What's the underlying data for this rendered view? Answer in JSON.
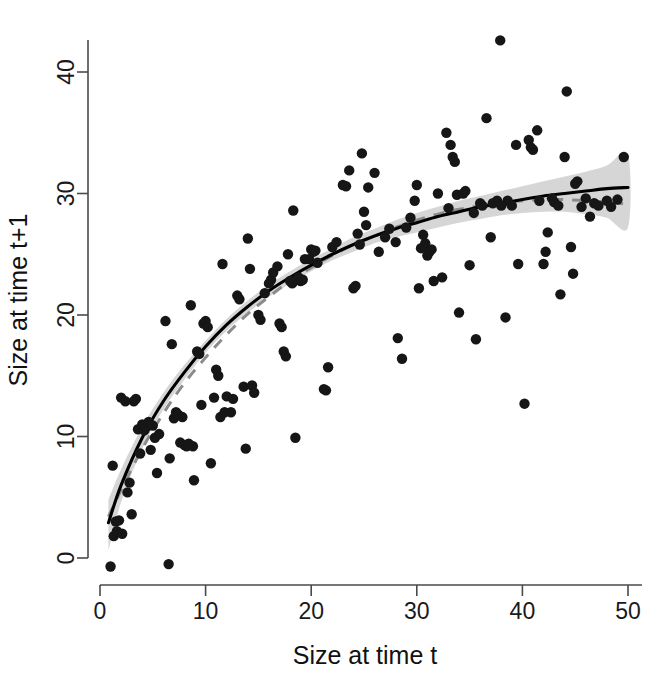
{
  "figure": {
    "background_color": "#ffffff",
    "width": 669,
    "height": 676
  },
  "chart_data": {
    "type": "scatter",
    "title": "",
    "subtitle": "",
    "xlabel": "Size at time t",
    "ylabel": "Size at time t+1",
    "xlim": [
      -1.5,
      52
    ],
    "ylim": [
      -3.0,
      45.5
    ],
    "xticks": [
      0,
      10,
      20,
      30,
      40,
      50
    ],
    "yticks": [
      0,
      10,
      20,
      30,
      40
    ],
    "xtick_labels": [
      "0",
      "10",
      "20",
      "30",
      "40",
      "50"
    ],
    "ytick_labels": [
      "0",
      "10",
      "20",
      "30",
      "40"
    ],
    "grid": false,
    "legend": false,
    "legend_position": "none",
    "point_color": "#161616",
    "point_radius": 5.2,
    "n_points": 178,
    "points": [
      [
        1.0,
        -0.7
      ],
      [
        1.2,
        7.6
      ],
      [
        1.3,
        1.8
      ],
      [
        1.5,
        3.0
      ],
      [
        1.6,
        2.2
      ],
      [
        1.8,
        3.1
      ],
      [
        2.0,
        13.2
      ],
      [
        2.1,
        2.0
      ],
      [
        2.4,
        12.9
      ],
      [
        2.6,
        5.4
      ],
      [
        2.8,
        6.2
      ],
      [
        3.0,
        3.6
      ],
      [
        3.2,
        12.9
      ],
      [
        3.4,
        13.1
      ],
      [
        3.6,
        10.6
      ],
      [
        3.8,
        8.6
      ],
      [
        4.0,
        11.0
      ],
      [
        4.2,
        10.5
      ],
      [
        4.4,
        10.8
      ],
      [
        4.6,
        11.2
      ],
      [
        4.8,
        8.9
      ],
      [
        5.0,
        10.9
      ],
      [
        5.2,
        9.9
      ],
      [
        5.4,
        7.0
      ],
      [
        5.6,
        10.2
      ],
      [
        6.2,
        19.5
      ],
      [
        6.5,
        -0.5
      ],
      [
        6.6,
        8.2
      ],
      [
        6.8,
        17.6
      ],
      [
        7.0,
        11.5
      ],
      [
        7.2,
        12.0
      ],
      [
        7.4,
        11.8
      ],
      [
        7.6,
        9.5
      ],
      [
        7.8,
        11.6
      ],
      [
        8.0,
        9.3
      ],
      [
        8.2,
        9.2
      ],
      [
        8.4,
        9.4
      ],
      [
        8.6,
        20.8
      ],
      [
        8.8,
        9.2
      ],
      [
        8.9,
        6.4
      ],
      [
        9.2,
        17.0
      ],
      [
        9.4,
        16.8
      ],
      [
        9.6,
        12.6
      ],
      [
        9.8,
        19.3
      ],
      [
        10.0,
        19.5
      ],
      [
        10.2,
        19.0
      ],
      [
        10.5,
        7.8
      ],
      [
        10.8,
        13.2
      ],
      [
        11.0,
        15.5
      ],
      [
        11.2,
        15.0
      ],
      [
        11.4,
        11.6
      ],
      [
        11.6,
        24.2
      ],
      [
        11.8,
        12.0
      ],
      [
        12.0,
        13.3
      ],
      [
        12.4,
        12.0
      ],
      [
        12.6,
        13.1
      ],
      [
        13.0,
        21.6
      ],
      [
        13.2,
        21.3
      ],
      [
        13.6,
        14.1
      ],
      [
        13.8,
        9.0
      ],
      [
        14.0,
        26.3
      ],
      [
        14.2,
        23.8
      ],
      [
        14.4,
        14.2
      ],
      [
        14.6,
        13.6
      ],
      [
        15.0,
        20.0
      ],
      [
        15.2,
        19.6
      ],
      [
        15.6,
        21.8
      ],
      [
        16.0,
        22.6
      ],
      [
        16.2,
        22.9
      ],
      [
        16.4,
        23.5
      ],
      [
        16.8,
        24.0
      ],
      [
        17.0,
        19.3
      ],
      [
        17.2,
        19.0
      ],
      [
        17.4,
        17.0
      ],
      [
        17.6,
        16.6
      ],
      [
        17.8,
        25.0
      ],
      [
        18.0,
        22.8
      ],
      [
        18.2,
        22.6
      ],
      [
        18.3,
        28.6
      ],
      [
        18.5,
        9.9
      ],
      [
        18.8,
        23.1
      ],
      [
        19.0,
        22.8
      ],
      [
        19.2,
        22.9
      ],
      [
        19.4,
        24.6
      ],
      [
        19.8,
        24.6
      ],
      [
        20.0,
        25.4
      ],
      [
        20.2,
        25.2
      ],
      [
        20.4,
        25.3
      ],
      [
        20.6,
        24.3
      ],
      [
        21.2,
        13.9
      ],
      [
        21.4,
        13.8
      ],
      [
        21.6,
        15.7
      ],
      [
        22.0,
        25.6
      ],
      [
        22.4,
        26.0
      ],
      [
        23.0,
        30.7
      ],
      [
        23.3,
        30.6
      ],
      [
        23.6,
        31.9
      ],
      [
        24.0,
        22.2
      ],
      [
        24.2,
        22.4
      ],
      [
        24.4,
        26.7
      ],
      [
        24.6,
        25.8
      ],
      [
        24.8,
        33.3
      ],
      [
        25.0,
        28.5
      ],
      [
        25.2,
        27.4
      ],
      [
        25.4,
        30.5
      ],
      [
        26.0,
        31.7
      ],
      [
        26.4,
        25.2
      ],
      [
        27.0,
        26.4
      ],
      [
        27.4,
        27.1
      ],
      [
        28.0,
        26.0
      ],
      [
        28.2,
        18.1
      ],
      [
        28.6,
        16.4
      ],
      [
        29.0,
        27.2
      ],
      [
        29.4,
        28.0
      ],
      [
        29.8,
        29.4
      ],
      [
        30.0,
        30.7
      ],
      [
        30.2,
        22.2
      ],
      [
        30.4,
        25.5
      ],
      [
        30.6,
        26.6
      ],
      [
        30.8,
        25.9
      ],
      [
        31.0,
        24.9
      ],
      [
        31.2,
        25.2
      ],
      [
        31.4,
        25.4
      ],
      [
        31.6,
        22.8
      ],
      [
        32.0,
        30.0
      ],
      [
        32.4,
        23.1
      ],
      [
        32.8,
        35.0
      ],
      [
        33.0,
        28.8
      ],
      [
        33.2,
        34.0
      ],
      [
        33.4,
        33.0
      ],
      [
        33.6,
        32.6
      ],
      [
        33.8,
        29.9
      ],
      [
        34.0,
        20.2
      ],
      [
        34.4,
        30.0
      ],
      [
        34.6,
        30.2
      ],
      [
        35.0,
        24.1
      ],
      [
        35.4,
        28.4
      ],
      [
        35.6,
        18.0
      ],
      [
        36.0,
        29.2
      ],
      [
        36.2,
        29.0
      ],
      [
        36.6,
        36.2
      ],
      [
        37.0,
        26.4
      ],
      [
        37.2,
        29.2
      ],
      [
        37.6,
        29.4
      ],
      [
        37.9,
        42.6
      ],
      [
        38.0,
        29.0
      ],
      [
        38.4,
        19.8
      ],
      [
        38.6,
        29.4
      ],
      [
        39.0,
        29.0
      ],
      [
        39.4,
        34.0
      ],
      [
        39.6,
        24.2
      ],
      [
        40.2,
        12.7
      ],
      [
        40.6,
        34.4
      ],
      [
        40.8,
        33.8
      ],
      [
        41.0,
        33.6
      ],
      [
        41.4,
        35.2
      ],
      [
        41.6,
        29.4
      ],
      [
        42.0,
        24.2
      ],
      [
        42.2,
        25.2
      ],
      [
        42.4,
        26.8
      ],
      [
        42.8,
        29.6
      ],
      [
        43.0,
        29.3
      ],
      [
        43.4,
        29.0
      ],
      [
        43.6,
        21.7
      ],
      [
        44.0,
        33.0
      ],
      [
        44.2,
        38.4
      ],
      [
        44.6,
        25.6
      ],
      [
        44.8,
        23.4
      ],
      [
        45.0,
        30.8
      ],
      [
        45.2,
        31.0
      ],
      [
        45.6,
        28.9
      ],
      [
        46.0,
        29.6
      ],
      [
        46.4,
        28.1
      ],
      [
        46.8,
        29.2
      ],
      [
        47.2,
        29.0
      ],
      [
        48.0,
        29.4
      ],
      [
        48.4,
        28.9
      ],
      [
        49.0,
        29.5
      ],
      [
        49.6,
        33.0
      ]
    ],
    "series": [
      {
        "name": "fitted-solid-curve",
        "style": "solid",
        "color": "#000000",
        "x": [
          0.8,
          2,
          4,
          6,
          8,
          10,
          12,
          14,
          16,
          18,
          20,
          22,
          24,
          26,
          28,
          30,
          32,
          34,
          36,
          38,
          40,
          42,
          44,
          46,
          48,
          50
        ],
        "y": [
          2.9,
          6.0,
          9.9,
          12.9,
          15.3,
          17.4,
          19.2,
          20.7,
          22.0,
          23.1,
          24.1,
          25.0,
          25.8,
          26.5,
          27.1,
          27.6,
          28.1,
          28.5,
          28.9,
          29.2,
          29.5,
          29.8,
          30.0,
          30.2,
          30.4,
          30.5
        ]
      },
      {
        "name": "fitted-dashed-curve",
        "style": "dashed",
        "color": "#8c8c8c",
        "x": [
          0.8,
          2,
          4,
          6,
          8,
          10,
          12,
          14,
          16,
          18,
          20,
          22,
          24,
          26,
          28,
          30,
          32,
          34,
          36,
          38,
          40,
          42,
          44,
          46,
          48,
          50
        ],
        "y": [
          3.4,
          5.6,
          9.0,
          11.9,
          14.4,
          16.5,
          18.4,
          20.1,
          21.5,
          22.8,
          23.9,
          24.9,
          25.8,
          26.5,
          27.2,
          27.8,
          28.3,
          28.7,
          29.0,
          29.3,
          29.4,
          29.5,
          29.5,
          29.4,
          29.3,
          29.1
        ]
      }
    ],
    "confidence_band": {
      "name": "confidence-interval-band",
      "color": "#d6d6d6",
      "x": [
        0.8,
        2,
        4,
        6,
        8,
        10,
        12,
        14,
        16,
        18,
        20,
        22,
        24,
        26,
        28,
        30,
        32,
        34,
        36,
        38,
        40,
        42,
        44,
        46,
        48,
        50
      ],
      "upper": [
        4.8,
        7.3,
        10.8,
        13.6,
        15.9,
        17.9,
        19.7,
        21.2,
        22.5,
        23.6,
        24.6,
        25.5,
        26.4,
        27.1,
        27.8,
        28.4,
        28.9,
        29.4,
        29.8,
        30.2,
        30.6,
        31.0,
        31.4,
        31.8,
        32.3,
        33.2
      ],
      "lower": [
        0.6,
        4.6,
        9.0,
        12.2,
        14.7,
        16.9,
        18.7,
        20.2,
        21.5,
        22.6,
        23.6,
        24.5,
        25.2,
        25.9,
        26.4,
        26.8,
        27.2,
        27.6,
        27.9,
        28.2,
        28.4,
        28.5,
        28.5,
        28.3,
        28.0,
        27.2
      ]
    }
  },
  "axes": {
    "x_title": "Size at time t",
    "y_title": "Size at time t+1",
    "axis_color": "#4a4a4a",
    "tick_label_color": "#1a1a1a"
  }
}
